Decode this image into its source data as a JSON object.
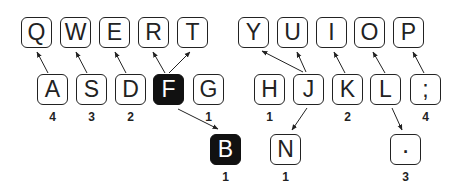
{
  "diagram": {
    "title": "",
    "top_row": [
      {
        "label": "Q",
        "x": 21,
        "y": 17
      },
      {
        "label": "W",
        "x": 60,
        "y": 17
      },
      {
        "label": "E",
        "x": 99,
        "y": 17
      },
      {
        "label": "R",
        "x": 138,
        "y": 17
      },
      {
        "label": "T",
        "x": 177,
        "y": 17
      },
      {
        "label": "Y",
        "x": 238,
        "y": 17
      },
      {
        "label": "U",
        "x": 277,
        "y": 17
      },
      {
        "label": "I",
        "x": 316,
        "y": 17
      },
      {
        "label": "O",
        "x": 354,
        "y": 17
      },
      {
        "label": "P",
        "x": 393,
        "y": 17
      }
    ],
    "home_row": [
      {
        "label": "A",
        "x": 37,
        "y": 74,
        "count": "4"
      },
      {
        "label": "S",
        "x": 76,
        "y": 74,
        "count": "3"
      },
      {
        "label": "D",
        "x": 115,
        "y": 74,
        "count": "2"
      },
      {
        "label": "F",
        "x": 153,
        "y": 74,
        "count": "",
        "highlight": true
      },
      {
        "label": "G",
        "x": 193,
        "y": 74,
        "count": "1"
      },
      {
        "label": "H",
        "x": 254,
        "y": 74,
        "count": "1"
      },
      {
        "label": "J",
        "x": 293,
        "y": 74,
        "count": ""
      },
      {
        "label": "K",
        "x": 332,
        "y": 74,
        "count": "2"
      },
      {
        "label": "L",
        "x": 370,
        "y": 74,
        "count": ""
      },
      {
        "label": ";",
        "x": 410,
        "y": 74,
        "count": "4"
      }
    ],
    "bottom_row": [
      {
        "label": "B",
        "x": 210,
        "y": 134,
        "count": "1",
        "highlight": true
      },
      {
        "label": "N",
        "x": 270,
        "y": 134,
        "count": "1"
      },
      {
        "label": "·",
        "x": 390,
        "y": 134,
        "count": "3"
      }
    ],
    "arrows": [
      {
        "from": "A",
        "to": "Q",
        "x1": 48,
        "y1": 73,
        "x2": 37,
        "y2": 52
      },
      {
        "from": "S",
        "to": "W",
        "x1": 87,
        "y1": 73,
        "x2": 76,
        "y2": 52
      },
      {
        "from": "D",
        "to": "E",
        "x1": 126,
        "y1": 73,
        "x2": 115,
        "y2": 52
      },
      {
        "from": "F",
        "to": "R",
        "x1": 165,
        "y1": 73,
        "x2": 153,
        "y2": 52
      },
      {
        "from": "F",
        "to": "T",
        "x1": 169,
        "y1": 73,
        "x2": 190,
        "y2": 52
      },
      {
        "from": "J",
        "to": "Y",
        "x1": 303,
        "y1": 72,
        "x2": 262,
        "y2": 51
      },
      {
        "from": "J",
        "to": "U",
        "x1": 306,
        "y1": 72,
        "x2": 297,
        "y2": 52
      },
      {
        "from": "K",
        "to": "I",
        "x1": 345,
        "y1": 73,
        "x2": 334,
        "y2": 52
      },
      {
        "from": "L",
        "to": "O",
        "x1": 385,
        "y1": 73,
        "x2": 373,
        "y2": 52
      },
      {
        "from": ";",
        "to": "P",
        "x1": 424,
        "y1": 73,
        "x2": 413,
        "y2": 52
      },
      {
        "from": "F",
        "to": "B",
        "x1": 178,
        "y1": 109,
        "x2": 218,
        "y2": 129
      },
      {
        "from": "J",
        "to": "N",
        "x1": 307,
        "y1": 108,
        "x2": 292,
        "y2": 130
      },
      {
        "from": "L",
        "to": "·",
        "x1": 392,
        "y1": 108,
        "x2": 402,
        "y2": 130
      }
    ]
  }
}
